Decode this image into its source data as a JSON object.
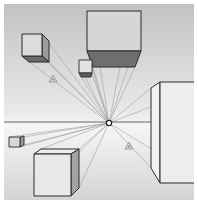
{
  "colors": {
    "background_top": "#c4c4c4",
    "background_bottom": "#f4f4f4",
    "outline": "#2a2a2a",
    "face_light": "#e6e6e6",
    "face_mid": "#a9a9a9",
    "face_dark": "#6a6a6a",
    "convergence_line": "#9a9a9a",
    "horizon": "#555555"
  },
  "horizon": {
    "y": 122,
    "x1": 4,
    "x2": 194
  },
  "vanishing_point": {
    "x": 109,
    "y": 123,
    "icon": "vanishing-point-icon"
  },
  "markers": [
    {
      "name": "warning-triangle-icon",
      "x": 53,
      "y": 80
    },
    {
      "name": "warning-triangle-icon",
      "x": 129,
      "y": 147
    }
  ],
  "objects": [
    {
      "name": "cube-top-left",
      "front": [
        22,
        34,
        20,
        22
      ],
      "depth_to": [
        49,
        62
      ]
    },
    {
      "name": "box-top-large",
      "front": [
        87,
        11,
        54,
        40
      ],
      "bottom_face": [
        [
          87,
          51
        ],
        [
          141,
          51
        ],
        [
          135,
          67
        ],
        [
          93,
          67
        ]
      ]
    },
    {
      "name": "cube-small-center",
      "front": [
        79,
        60,
        13,
        13
      ],
      "bottom_strip": 4
    },
    {
      "name": "cube-left-tiny",
      "front": [
        9,
        137,
        11,
        10
      ],
      "side_to": 24
    },
    {
      "name": "cube-bottom-left",
      "front": [
        34,
        154,
        37,
        42
      ],
      "top_back": [
        [
          41,
          149
        ],
        [
          79,
          149
        ]
      ]
    },
    {
      "name": "box-right-large",
      "front": [
        160,
        82,
        34,
        101
      ],
      "side_near": [
        [
          151,
          88
        ],
        [
          151,
          168
        ]
      ]
    }
  ]
}
